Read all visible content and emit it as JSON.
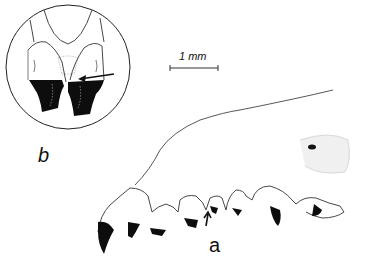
{
  "figure": {
    "panels": [
      {
        "id": "b",
        "label": "b",
        "description": "circular inset, enlarged view of two teeth with arrow"
      },
      {
        "id": "a",
        "label": "a",
        "description": "lateral view of jaw with row of teeth, arrow pointing to a tooth"
      }
    ],
    "scale_bar": {
      "label": "1 mm"
    },
    "colors": {
      "ink": "#111111",
      "background": "#ffffff"
    }
  }
}
